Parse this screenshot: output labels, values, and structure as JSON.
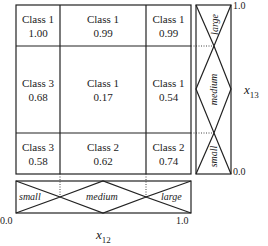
{
  "grid": {
    "rows": [
      [
        {
          "cls": "Class 1",
          "val": "1.00"
        },
        {
          "cls": "Class 1",
          "val": "0.99"
        },
        {
          "cls": "Class 1",
          "val": "0.99"
        }
      ],
      [
        {
          "cls": "Class 3",
          "val": "0.68"
        },
        {
          "cls": "Class 1",
          "val": "0.17"
        },
        {
          "cls": "Class 1",
          "val": "0.54"
        }
      ],
      [
        {
          "cls": "Class 3",
          "val": "0.58"
        },
        {
          "cls": "Class 2",
          "val": "0.62"
        },
        {
          "cls": "Class 2",
          "val": "0.74"
        }
      ]
    ]
  },
  "x_axis": {
    "name": "x",
    "sub": "12",
    "min": "0.0",
    "max": "1.0",
    "sets": [
      "small",
      "medium",
      "large"
    ]
  },
  "y_axis": {
    "name": "x",
    "sub": "13",
    "min": "0.0",
    "max": "1.0",
    "sets": [
      "small",
      "medium",
      "large"
    ]
  }
}
